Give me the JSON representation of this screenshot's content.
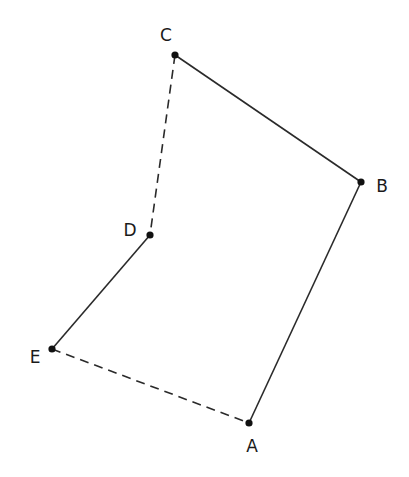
{
  "diagram": {
    "type": "polygon-path",
    "points": [
      {
        "id": "A",
        "label": "A",
        "x": 249,
        "y": 423,
        "label_x": 252,
        "label_y": 452
      },
      {
        "id": "B",
        "label": "B",
        "x": 361,
        "y": 182,
        "label_x": 382,
        "label_y": 192
      },
      {
        "id": "C",
        "label": "C",
        "x": 175,
        "y": 55,
        "label_x": 166,
        "label_y": 41
      },
      {
        "id": "D",
        "label": "D",
        "x": 150,
        "y": 235,
        "label_x": 130,
        "label_y": 236
      },
      {
        "id": "E",
        "label": "E",
        "x": 52,
        "y": 349,
        "label_x": 35,
        "label_y": 363
      }
    ],
    "segments": [
      {
        "from": "A",
        "to": "B",
        "style": "solid"
      },
      {
        "from": "B",
        "to": "C",
        "style": "solid"
      },
      {
        "from": "C",
        "to": "D",
        "style": "dashed"
      },
      {
        "from": "D",
        "to": "E",
        "style": "solid"
      },
      {
        "from": "E",
        "to": "A",
        "style": "dashed"
      }
    ],
    "colors": {
      "line": "#2a2a2a",
      "point": "#111111",
      "label": "#1a1a1a"
    }
  }
}
